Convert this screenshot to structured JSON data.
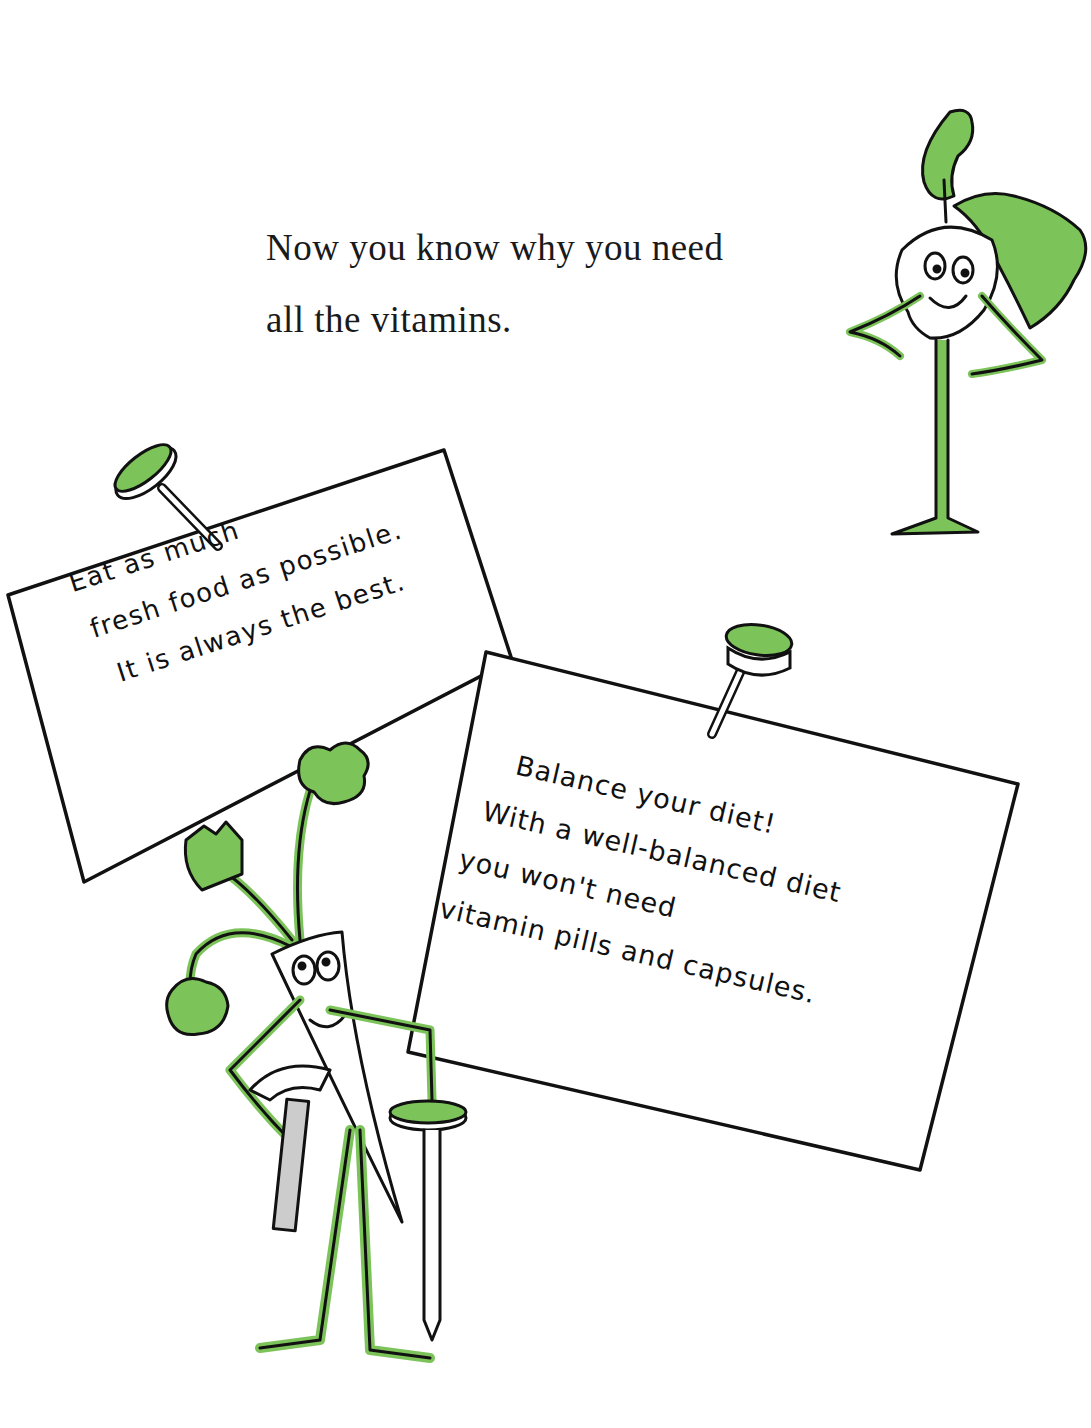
{
  "page": {
    "intro_text": {
      "line1": "Now you know why you need",
      "line2": "all the vitamins."
    },
    "note_left": {
      "line1": "Eat as much",
      "line2": "fresh food as possible.",
      "line3": "It is always the best."
    },
    "note_right": {
      "line1": "Balance your diet!",
      "line2": "With a well-balanced diet",
      "line3": "you won't need",
      "line4": "vitamin pills and capsules."
    },
    "illustrations": [
      {
        "name": "turnip-character",
        "description": "smiling turnip with green leaves, hands on hips"
      },
      {
        "name": "carrot-character",
        "description": "carrot character holding a hammer and a pushpin"
      },
      {
        "name": "pushpin-left",
        "description": "green pushpin on left note"
      },
      {
        "name": "pushpin-right",
        "description": "green pushpin on right note"
      }
    ],
    "colors": {
      "accent_green": "#7cc35a",
      "ink": "#111111",
      "paper": "#ffffff"
    }
  }
}
